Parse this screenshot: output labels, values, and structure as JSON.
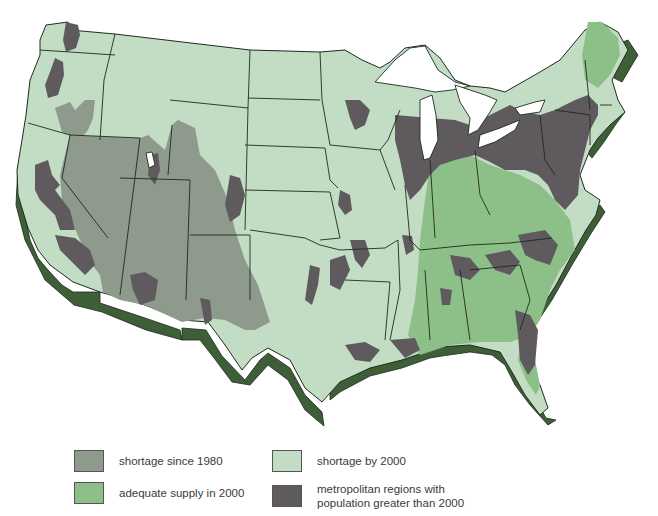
{
  "map": {
    "subject": "Contiguous United States water supply outlook",
    "colors": {
      "shortage_since_1980": "#8e9a8c",
      "shortage_by_2000": "#c3ddc5",
      "adequate_supply_2000": "#8cc088",
      "metropolitan": "#5e5a5e",
      "coast_extrusion": "#3e5e38",
      "lakes": "#ffffff",
      "border": "#1e2a1e"
    }
  },
  "legend": {
    "items": [
      {
        "key": "shortage_since_1980",
        "label": "shortage since 1980",
        "color": "#8e9a8c"
      },
      {
        "key": "shortage_by_2000",
        "label": "shortage by 2000",
        "color": "#c3ddc5"
      },
      {
        "key": "adequate_supply_2000",
        "label": "adequate supply in 2000",
        "color": "#8cc088"
      },
      {
        "key": "metropolitan",
        "label": "metropolitan regions with\npopulation greater than 2000",
        "color": "#5e5a5e"
      }
    ]
  }
}
